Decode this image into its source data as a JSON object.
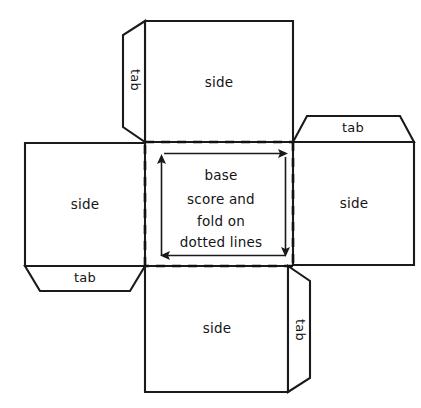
{
  "diagram": {
    "name": "cube-net-fold-pattern",
    "background_color": "#ffffff",
    "ink_color": "#1a1a1a",
    "width": 421,
    "height": 408
  },
  "panels": {
    "top_side": {
      "label": "side"
    },
    "left_side": {
      "label": "side"
    },
    "right_side": {
      "label": "side"
    },
    "bottom_side": {
      "label": "side"
    },
    "base": {
      "label_line_1": "base",
      "label_line_2": "score and",
      "label_line_3": "fold on",
      "label_line_4": "dotted lines"
    }
  },
  "tabs": {
    "top_left_tab": {
      "label": "tab",
      "rotation": 180
    },
    "right_top_tab": {
      "label": "tab",
      "rotation": 0
    },
    "left_bottom_tab": {
      "label": "tab",
      "rotation": 0
    },
    "bottom_right_tab": {
      "label": "tab",
      "rotation": 180
    }
  },
  "arrows": {
    "top_arrow": {
      "direction": "right"
    },
    "right_arrow": {
      "direction": "down"
    },
    "bottom_arrow": {
      "direction": "left"
    },
    "left_arrow": {
      "direction": "up"
    }
  }
}
